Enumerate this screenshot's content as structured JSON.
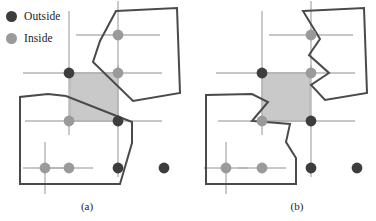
{
  "figure": {
    "kind": "geometry-diagram",
    "colors": {
      "outside_dot": "#3d3d3d",
      "inside_dot": "#9a9a9a",
      "polygon_stroke": "#4a4a4a",
      "grid_line": "#b4b4b4",
      "shaded_cell_fill": "#c9c9c9",
      "shaded_cell_stroke": "#b0b0b0",
      "background": "#ffffff",
      "text": "#1c1c1c"
    },
    "legend": {
      "items": [
        {
          "label": "Outside",
          "marker": "filled-circle-dark",
          "color": "#3d3d3d"
        },
        {
          "label": "Inside",
          "marker": "filled-circle-gray",
          "color": "#9a9a9a"
        }
      ]
    },
    "captions": [
      {
        "id": "a",
        "text": "(a)"
      },
      {
        "id": "b",
        "text": "(b)"
      }
    ],
    "panels": [
      {
        "id": "a",
        "caption": "(a)",
        "shaded_cell": {
          "x": 70,
          "y": 73,
          "width": 48,
          "height": 48
        },
        "grid_crosses": [
          {
            "cx": 118,
            "cy": 35,
            "hw": 42,
            "vh": 34
          },
          {
            "cx": 69,
            "cy": 73,
            "hw": 46,
            "vh": 62
          },
          {
            "cx": 118,
            "cy": 73,
            "hw": 44,
            "vh": 0
          },
          {
            "cx": 69,
            "cy": 121,
            "hw": 44,
            "vh": 0
          },
          {
            "cx": 118,
            "cy": 121,
            "hw": 44,
            "vh": 56
          },
          {
            "cx": 45,
            "cy": 168,
            "hw": 22,
            "vh": 26
          },
          {
            "cx": 69,
            "cy": 168,
            "hw": 24,
            "vh": 0
          },
          {
            "cx": 164,
            "cy": 168,
            "hw": 0,
            "vh": 0
          }
        ],
        "points": [
          {
            "x": 118,
            "y": 35,
            "class": "Inside"
          },
          {
            "x": 69,
            "y": 73,
            "class": "Outside"
          },
          {
            "x": 118,
            "y": 73,
            "class": "Inside"
          },
          {
            "x": 69,
            "y": 121,
            "class": "Inside"
          },
          {
            "x": 118,
            "y": 121,
            "class": "Outside"
          },
          {
            "x": 45,
            "y": 168,
            "class": "Inside"
          },
          {
            "x": 69,
            "y": 168,
            "class": "Inside"
          },
          {
            "x": 118,
            "y": 168,
            "class": "Outside"
          },
          {
            "x": 164,
            "y": 168,
            "class": "Outside"
          }
        ],
        "polygons": [
          {
            "name": "upper-right-polygon",
            "vertices": "116,11 177,8 180,93 133,101 93,62 100,41"
          },
          {
            "name": "lower-left-polygon",
            "vertices": "20,184 20,97 48,94 66,96 132,122 132,143 120,184"
          }
        ]
      },
      {
        "id": "b",
        "caption": "(b)",
        "shaded_cell": {
          "x": 262,
          "y": 73,
          "width": 48,
          "height": 48
        },
        "grid_crosses": [
          {
            "cx": 311,
            "cy": 35,
            "hw": 42,
            "vh": 34
          },
          {
            "cx": 262,
            "cy": 73,
            "hw": 46,
            "vh": 62
          },
          {
            "cx": 311,
            "cy": 73,
            "hw": 44,
            "vh": 0
          },
          {
            "cx": 262,
            "cy": 121,
            "hw": 44,
            "vh": 0
          },
          {
            "cx": 311,
            "cy": 121,
            "hw": 44,
            "vh": 56
          },
          {
            "cx": 226,
            "cy": 168,
            "hw": 22,
            "vh": 26
          },
          {
            "cx": 262,
            "cy": 168,
            "hw": 24,
            "vh": 0
          },
          {
            "cx": 357,
            "cy": 168,
            "hw": 0,
            "vh": 0
          }
        ],
        "points": [
          {
            "x": 311,
            "y": 35,
            "class": "Inside"
          },
          {
            "x": 262,
            "y": 73,
            "class": "Outside"
          },
          {
            "x": 311,
            "y": 73,
            "class": "Inside"
          },
          {
            "x": 262,
            "y": 121,
            "class": "Inside"
          },
          {
            "x": 311,
            "y": 121,
            "class": "Outside"
          },
          {
            "x": 226,
            "y": 168,
            "class": "Inside"
          },
          {
            "x": 262,
            "y": 168,
            "class": "Inside"
          },
          {
            "x": 311,
            "y": 168,
            "class": "Outside"
          },
          {
            "x": 357,
            "y": 168,
            "class": "Outside"
          }
        ],
        "polygons": [
          {
            "name": "upper-right-polygon",
            "vertices": "303,11 364,8 367,93 325,100 311,85 329,73 309,55 320,39"
          },
          {
            "name": "lower-left-polygon",
            "vertices": "206,184 206,95 252,94 268,102 252,121 290,124 286,142 296,158 296,184"
          }
        ]
      }
    ]
  }
}
